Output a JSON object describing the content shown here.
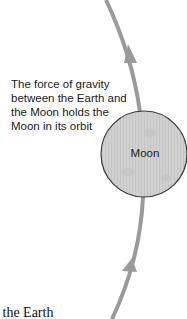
{
  "caption": {
    "line1": "The force of gravity",
    "line2": "between the Earth and",
    "line3": "the Moon holds the",
    "line4": "Moon in its orbit"
  },
  "moon": {
    "label": "Moon",
    "fill_color": "#cfcfcf",
    "outline_color": "#3a3a3a"
  },
  "orbit": {
    "color": "#9a9a9a",
    "direction": "upward"
  },
  "bottom_text": "d the Earth"
}
